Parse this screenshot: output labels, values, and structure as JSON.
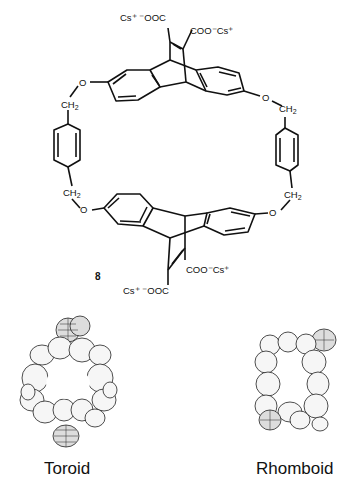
{
  "diagram": {
    "compound_number": "8",
    "top_carboxylates": {
      "left": "Cs⁺ ⁻OOC",
      "right": "COO⁻Cs⁺"
    },
    "bottom_carboxylates": {
      "left": "Cs⁺ ⁻OOC",
      "right": "COO⁻Cs⁺"
    },
    "linkers": {
      "oxygen": "O",
      "methylene": "CH",
      "methylene_sub": "2"
    },
    "models": [
      {
        "label": "Toroid"
      },
      {
        "label": "Rhomboid"
      }
    ],
    "colors": {
      "line": "#111111",
      "background": "#ffffff"
    }
  }
}
